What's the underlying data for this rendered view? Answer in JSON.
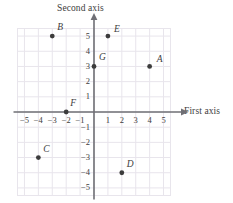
{
  "chart_data": {
    "type": "scatter",
    "title": "",
    "xlabel": "First axis",
    "ylabel": "Second axis",
    "xlim": [
      -5.5,
      5.5
    ],
    "ylim": [
      -5.5,
      5.5
    ],
    "grid": true,
    "legend": "none",
    "xticks": [
      -5,
      -4,
      -3,
      -2,
      -1,
      1,
      2,
      3,
      4,
      5
    ],
    "xtick_labels": [
      "−5",
      "−4",
      "−3",
      "−2",
      "−1",
      "1",
      "2",
      "3",
      "4",
      "5"
    ],
    "yticks": [
      5,
      4,
      3,
      2,
      1,
      -1,
      -2,
      -3,
      -4,
      -5
    ],
    "ytick_labels": [
      "5",
      "4",
      "3",
      "2",
      "1",
      "−1",
      "−2",
      "−3",
      "−4",
      "−5"
    ],
    "points": [
      {
        "label": "A",
        "x": 4,
        "y": 3,
        "label_dx": 7,
        "label_dy": -11
      },
      {
        "label": "B",
        "x": -3,
        "y": 5,
        "label_dx": 5,
        "label_dy": -13
      },
      {
        "label": "C",
        "x": -4,
        "y": -3,
        "label_dx": 5,
        "label_dy": -13
      },
      {
        "label": "D",
        "x": 2,
        "y": -4,
        "label_dx": 5,
        "label_dy": -13
      },
      {
        "label": "E",
        "x": 1,
        "y": 5,
        "label_dx": 6,
        "label_dy": -11
      },
      {
        "label": "F",
        "x": -2,
        "y": 0,
        "label_dx": 4,
        "label_dy": -13
      },
      {
        "label": "G",
        "x": 0,
        "y": 3,
        "label_dx": 5,
        "label_dy": -13
      }
    ]
  },
  "colors": {
    "grid": "#e8e5ec",
    "axis": "#6f6f75",
    "point": "#3c3c3c",
    "text": "#3d3d3d",
    "background": "#ffffff"
  },
  "axis_titles": {
    "first": "First axis",
    "second": "Second axis"
  }
}
